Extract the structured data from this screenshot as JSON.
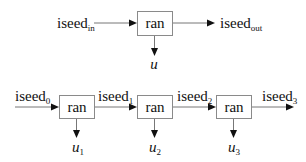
{
  "diagram": {
    "colors": {
      "box_stroke": "#8a8a8a",
      "line": "#777777",
      "arrowhead": "#111111",
      "text": "#111111"
    },
    "single": {
      "box_label": "ran",
      "input": {
        "base": "iseed",
        "sub": "in"
      },
      "output": {
        "base": "iseed",
        "sub": "out"
      },
      "result": {
        "base": "u",
        "sub": ""
      }
    },
    "chain": {
      "boxes": [
        {
          "label": "ran",
          "result": {
            "base": "u",
            "sub": "1"
          }
        },
        {
          "label": "ran",
          "result": {
            "base": "u",
            "sub": "2"
          }
        },
        {
          "label": "ran",
          "result": {
            "base": "u",
            "sub": "3"
          }
        }
      ],
      "seeds": [
        {
          "base": "iseed",
          "sub": "0"
        },
        {
          "base": "iseed",
          "sub": "1"
        },
        {
          "base": "iseed",
          "sub": "2"
        },
        {
          "base": "iseed",
          "sub": "3"
        }
      ]
    }
  }
}
